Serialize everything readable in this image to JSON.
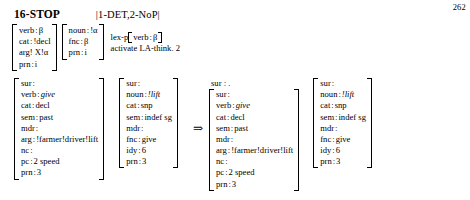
{
  "page": {
    "number": "262"
  },
  "rule": {
    "name": "16-STOP",
    "pattern": "|1-DET,2-NoP|",
    "pattern_open": "|",
    "pattern_close": "|",
    "input_matrices": [
      {
        "name": "verb-pattern-matrix",
        "rows": [
          {
            "attr": "verb",
            "colon": ":",
            "val": "β",
            "italic": false
          },
          {
            "attr": "cat",
            "colon": ":",
            "val": "!decl",
            "italic": false
          },
          {
            "attr": "arg!",
            "colon": "",
            "val": "X!α",
            "italic": false
          },
          {
            "attr": "prn",
            "colon": ":",
            "val": "i",
            "italic": false
          }
        ]
      },
      {
        "name": "noun-pattern-matrix",
        "rows": [
          {
            "attr": "noun",
            "colon": ":",
            "val": "!α",
            "italic": false
          },
          {
            "attr": "fnc",
            "colon": ":",
            "val": "β",
            "italic": false
          },
          {
            "attr": "prn",
            "colon": ":",
            "val": "i",
            "italic": false
          }
        ]
      }
    ],
    "operations": {
      "lex_prefix": "lex-p",
      "lex_inner_attr": "verb",
      "lex_inner_colon": ":",
      "lex_inner_val": "β",
      "activate": "activate LA-think. 2"
    }
  },
  "derivation": {
    "arrow": "⇒",
    "input": [
      {
        "name": "give-input-matrix",
        "rows": [
          {
            "attr": "sur",
            "colon": ":",
            "val": "",
            "italic": false
          },
          {
            "attr": "verb",
            "colon": ":",
            "val": "give",
            "italic": true
          },
          {
            "attr": "cat",
            "colon": ":",
            "val": "decl",
            "italic": false
          },
          {
            "attr": "sem",
            "colon": ":",
            "val": "past",
            "italic": false
          },
          {
            "attr": "mdr",
            "colon": ":",
            "val": "",
            "italic": false
          },
          {
            "attr": "arg",
            "colon": ":",
            "val": "!farmer!driver!lift",
            "italic": false
          },
          {
            "attr": "nc",
            "colon": ":",
            "val": "",
            "italic": false
          },
          {
            "attr": "pc",
            "colon": ":",
            "val": "2  speed",
            "italic": false
          },
          {
            "attr": "prn",
            "colon": ":",
            "val": "3",
            "italic": false
          }
        ]
      },
      {
        "name": "lift-input-matrix",
        "rows": [
          {
            "attr": "sur",
            "colon": ":",
            "val": "",
            "italic": false
          },
          {
            "attr": "noun",
            "colon": ":",
            "val": "!lift",
            "italic": true
          },
          {
            "attr": "cat",
            "colon": ":",
            "val": "snp",
            "italic": false
          },
          {
            "attr": "sem",
            "colon": ":",
            "val": "indef  sg",
            "italic": false
          },
          {
            "attr": "mdr",
            "colon": ":",
            "val": "",
            "italic": false
          },
          {
            "attr": "fnc",
            "colon": ":",
            "val": "give",
            "italic": false
          },
          {
            "attr": "idy",
            "colon": ":",
            "val": "6",
            "italic": false
          },
          {
            "attr": "prn",
            "colon": ":",
            "val": "3",
            "italic": false
          }
        ]
      }
    ],
    "output_surface": "sur : .",
    "output": [
      {
        "name": "give-output-matrix",
        "rows": [
          {
            "attr": "sur",
            "colon": ":",
            "val": "",
            "italic": false
          },
          {
            "attr": "verb",
            "colon": ":",
            "val": "give",
            "italic": true
          },
          {
            "attr": "cat",
            "colon": ":",
            "val": "decl",
            "italic": false
          },
          {
            "attr": "sem",
            "colon": ":",
            "val": "past",
            "italic": false
          },
          {
            "attr": "mdr",
            "colon": ":",
            "val": "",
            "italic": false
          },
          {
            "attr": "arg",
            "colon": ":",
            "val": "!farmer!driver!lift",
            "italic": false
          },
          {
            "attr": "nc",
            "colon": ":",
            "val": "",
            "italic": false
          },
          {
            "attr": "pc",
            "colon": ":",
            "val": "2  speed",
            "italic": false
          },
          {
            "attr": "prn",
            "colon": ":",
            "val": "3",
            "italic": false
          }
        ]
      },
      {
        "name": "lift-output-matrix",
        "rows": [
          {
            "attr": "sur",
            "colon": ":",
            "val": "",
            "italic": false
          },
          {
            "attr": "noun",
            "colon": ":",
            "val": "!lift",
            "italic": true
          },
          {
            "attr": "cat",
            "colon": ":",
            "val": "snp",
            "italic": false
          },
          {
            "attr": "sem",
            "colon": ":",
            "val": "indef  sg",
            "italic": false
          },
          {
            "attr": "mdr",
            "colon": ":",
            "val": "",
            "italic": false
          },
          {
            "attr": "fnc",
            "colon": ":",
            "val": "give",
            "italic": false
          },
          {
            "attr": "idy",
            "colon": ":",
            "val": "6",
            "italic": false
          },
          {
            "attr": "prn",
            "colon": ":",
            "val": "3",
            "italic": false
          }
        ]
      }
    ]
  }
}
